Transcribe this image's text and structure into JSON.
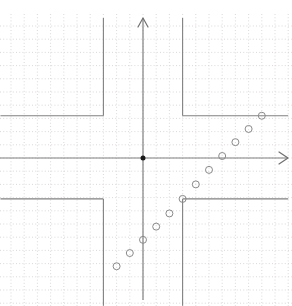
{
  "figure": {
    "title": "",
    "background_color": "#ffffff",
    "width": 292,
    "height": 306
  },
  "axes": {
    "origin_px": [
      143.0,
      158.0
    ],
    "unit_px": 13.2,
    "x_axis": {
      "label": "",
      "color": "#808080",
      "arrow": "arrow-right",
      "x_start_px": 0,
      "x_end_px": 288,
      "y_px": 158
    },
    "y_axis": {
      "label": "",
      "color": "#808080",
      "arrow": "arrow-up",
      "y_start_px": 300,
      "y_end_px": 18,
      "x_px": 143
    },
    "xlim": [
      -10.8,
      11.0
    ],
    "ylim": [
      -11.2,
      10.6
    ],
    "grid": {
      "visible": true,
      "style": "dotted",
      "color": "#d9d4d4",
      "spacing_units": 1
    }
  },
  "chart_data": {
    "type": "scatter",
    "title": "",
    "xlabel": "",
    "ylabel": "",
    "xlim": [
      -10.8,
      11.0
    ],
    "ylim": [
      -11.2,
      10.6
    ],
    "grid": true,
    "legend": null,
    "series": [
      {
        "name": "step-function",
        "type": "line",
        "style": "solid",
        "color": "#808080",
        "description": "Piecewise-constant step function with jumps at x = -3 and x = 3",
        "segments": [
          {
            "x": [
              -10.8,
              -3.0
            ],
            "y": [
              3.2,
              3.2
            ]
          },
          {
            "x": [
              -3.0,
              -3.0
            ],
            "y": [
              3.2,
              10.6
            ]
          },
          {
            "x": [
              3.0,
              3.0
            ],
            "y": [
              10.6,
              3.2
            ]
          },
          {
            "x": [
              3.0,
              11.0
            ],
            "y": [
              3.2,
              3.2
            ]
          },
          {
            "x": [
              -10.8,
              -3.0
            ],
            "y": [
              -3.1,
              -3.1
            ]
          },
          {
            "x": [
              -3.0,
              -3.0
            ],
            "y": [
              -3.1,
              -11.2
            ]
          },
          {
            "x": [
              3.0,
              3.0
            ],
            "y": [
              -3.1,
              -11.2
            ]
          },
          {
            "x": [
              3.0,
              11.0
            ],
            "y": [
              -3.1,
              -3.1
            ]
          }
        ]
      },
      {
        "name": "sample-points",
        "type": "scatter",
        "marker": "open-circle",
        "color": "#8a8a8a",
        "marker_size_px": 7,
        "points": [
          {
            "x": -2.0,
            "y": -8.2
          },
          {
            "x": -1.0,
            "y": -7.2
          },
          {
            "x": 0.0,
            "y": -6.2
          },
          {
            "x": 1.0,
            "y": -5.2
          },
          {
            "x": 2.0,
            "y": -4.2
          },
          {
            "x": 3.0,
            "y": -3.1
          },
          {
            "x": 4.0,
            "y": -2.0
          },
          {
            "x": 5.0,
            "y": -0.9
          },
          {
            "x": 6.0,
            "y": 0.15
          },
          {
            "x": 7.0,
            "y": 1.2
          },
          {
            "x": 8.0,
            "y": 2.2
          },
          {
            "x": 9.0,
            "y": 3.2
          }
        ]
      },
      {
        "name": "origin-marker",
        "type": "scatter",
        "marker": "filled-circle",
        "color": "#1a1a1a",
        "marker_size_px": 5,
        "points": [
          {
            "x": 0.0,
            "y": 0.0
          }
        ]
      }
    ]
  }
}
